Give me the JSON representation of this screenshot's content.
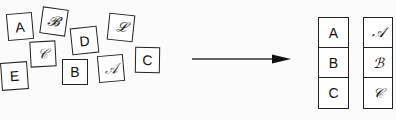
{
  "scattered_tiles": [
    {
      "label": "A",
      "style": "print"
    },
    {
      "label": "𝓑",
      "style": "script"
    },
    {
      "label": "𝒞",
      "style": "script"
    },
    {
      "label": "D",
      "style": "print"
    },
    {
      "label": "𝓛",
      "style": "script"
    },
    {
      "label": "E",
      "style": "print"
    },
    {
      "label": "B",
      "style": "print"
    },
    {
      "label": "𝒜",
      "style": "script"
    },
    {
      "label": "C",
      "style": "print"
    }
  ],
  "sorted": {
    "print_column": [
      "A",
      "B",
      "C"
    ],
    "script_column": [
      "𝒜",
      "ℬ",
      "𝒞"
    ]
  },
  "colors": {
    "stroke": "#222222",
    "background": "#fbfbfb"
  }
}
